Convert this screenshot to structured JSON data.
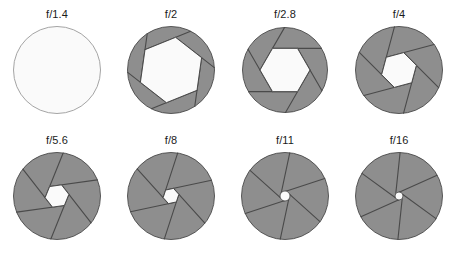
{
  "figure": {
    "name": "camera-aperture-f-stop-diagram",
    "columns": 4,
    "rows": 2,
    "blade_count": 6,
    "colors": {
      "blade_fill": "#8e8e8e",
      "blade_edge": "#4a4a4a",
      "opening_fill": "#fafafa",
      "opening_edge": "#4a4a4a",
      "open_circle_edge": "#9a9a9a",
      "label_color": "#1b1b1b",
      "background": "#ffffff"
    }
  },
  "apertures": [
    {
      "label": "f/1.4",
      "id": "aperture-f1-4",
      "fstop": 1.4,
      "blades_visible": false,
      "opening_radius": 44,
      "opening_rotation": 0,
      "circle_radius": 44,
      "center_dot": false
    },
    {
      "label": "f/2",
      "id": "aperture-f2",
      "fstop": 2,
      "blades_visible": true,
      "opening_radius": 33,
      "opening_rotation": 8,
      "circle_radius": 44,
      "center_dot": false
    },
    {
      "label": "f/2.8",
      "id": "aperture-f2-8",
      "fstop": 2.8,
      "blades_visible": true,
      "opening_radius": 25,
      "opening_rotation": 30,
      "circle_radius": 43,
      "center_dot": false
    },
    {
      "label": "f/4",
      "id": "aperture-f4",
      "fstop": 4,
      "blades_visible": true,
      "opening_radius": 18,
      "opening_rotation": 15,
      "circle_radius": 44,
      "center_dot": false
    },
    {
      "label": "f/5.6",
      "id": "aperture-f5-6",
      "fstop": 5.6,
      "blades_visible": true,
      "opening_radius": 12,
      "opening_rotation": 22,
      "circle_radius": 44,
      "center_dot": false
    },
    {
      "label": "f/8",
      "id": "aperture-f8",
      "fstop": 8,
      "blades_visible": true,
      "opening_radius": 8,
      "opening_rotation": 18,
      "circle_radius": 44,
      "center_dot": false
    },
    {
      "label": "f/11",
      "id": "aperture-f11",
      "fstop": 11,
      "blades_visible": true,
      "opening_radius": 5,
      "opening_rotation": 12,
      "circle_radius": 44,
      "center_dot": true
    },
    {
      "label": "f/16",
      "id": "aperture-f16",
      "fstop": 16,
      "blades_visible": true,
      "opening_radius": 4,
      "opening_rotation": 6,
      "circle_radius": 44,
      "center_dot": true
    }
  ]
}
